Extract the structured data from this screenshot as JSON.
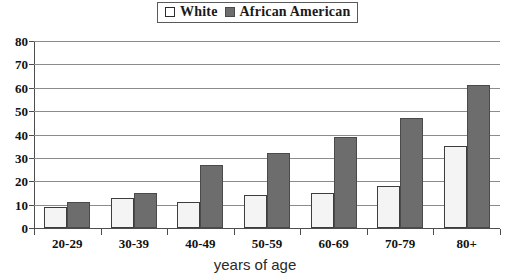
{
  "legend": {
    "entries": [
      {
        "label": "White",
        "swatch": "hollow-square",
        "color": "#ffffff"
      },
      {
        "label": "African American",
        "swatch": "filled-square",
        "color": "#6d6d6d"
      }
    ]
  },
  "axis": {
    "x_title": "years of age",
    "y_ticks": [
      "0",
      "10",
      "20",
      "30",
      "40",
      "50",
      "60",
      "70",
      "80"
    ]
  },
  "chart_data": {
    "type": "bar",
    "title": "",
    "subtitle": "",
    "xlabel": "years of age",
    "ylabel": "",
    "categories": [
      "20-29",
      "30-39",
      "40-49",
      "50-59",
      "60-69",
      "70-79",
      "80+"
    ],
    "series": [
      {
        "name": "White",
        "color": "#f4f4f4",
        "values": [
          9,
          13,
          11,
          14,
          15,
          18,
          35
        ]
      },
      {
        "name": "African American",
        "color": "#6d6d6d",
        "values": [
          11,
          15,
          27,
          32,
          39,
          47,
          61
        ]
      }
    ],
    "ylim": [
      0,
      80
    ],
    "ytick_step": 10,
    "grid": true,
    "legend_position": "top-center"
  }
}
